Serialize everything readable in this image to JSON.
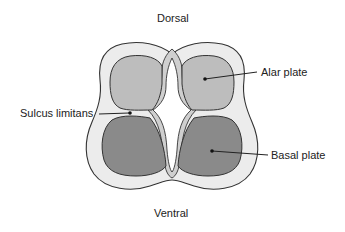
{
  "diagram": {
    "type": "neural tube cross-section",
    "labels": {
      "dorsal": "Dorsal",
      "ventral": "Ventral",
      "alar_plate": "Alar plate",
      "basal_plate": "Basal plate",
      "sulcus_limitans": "Sulcus limitans"
    },
    "colors": {
      "outer_layer": "#ececec",
      "alar_plate": "#bdbdbd",
      "basal_plate": "#8a8a8a",
      "lining": "#cfcfcf",
      "lumen": "#ffffff",
      "outline": "#333333"
    }
  }
}
